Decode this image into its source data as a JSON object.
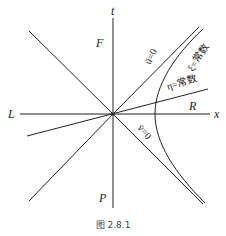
{
  "diagram": {
    "axes": {
      "time_label": "t",
      "space_label": "x"
    },
    "regions": {
      "future": "F",
      "past": "P",
      "left": "L",
      "right": "R"
    },
    "curves": {
      "null_u": "ū=0",
      "null_v": "v̄=0",
      "xi_const": "ξ=常数",
      "eta_const": "η=常数"
    },
    "caption": "图 2.8.1",
    "colors": {
      "line": "#222222",
      "background": "#ffffff"
    }
  }
}
